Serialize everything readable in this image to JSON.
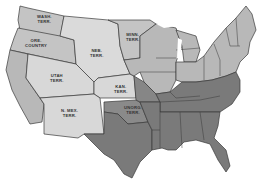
{
  "map": {
    "title": "United States",
    "colors": {
      "background": "#ffffff",
      "territory": "#d8d8d8",
      "union_state": "#b8b8b8",
      "confederate_state": "#808080",
      "border": "#3a3a3a",
      "label": "#333333"
    },
    "legend": null,
    "labels": [
      {
        "id": "wash",
        "line1": "WASH.",
        "line2": "TERR."
      },
      {
        "id": "ore",
        "line1": "ORE.",
        "line2": "COUNTRY"
      },
      {
        "id": "neb",
        "line1": "NEB.",
        "line2": "TERR."
      },
      {
        "id": "minn",
        "line1": "MINN.",
        "line2": "TERR."
      },
      {
        "id": "utah",
        "line1": "UTAH",
        "line2": "TERR."
      },
      {
        "id": "kan",
        "line1": "KAN.",
        "line2": "TERR."
      },
      {
        "id": "nmex",
        "line1": "N. MEX.",
        "line2": "TERR."
      },
      {
        "id": "unorg",
        "line1": "UNORG.",
        "line2": "TERR."
      }
    ]
  }
}
